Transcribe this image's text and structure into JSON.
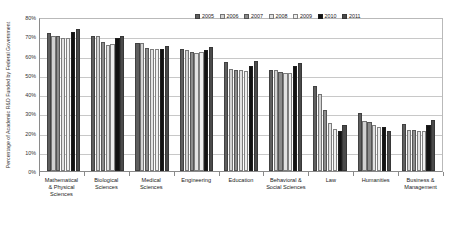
{
  "chart_data": {
    "type": "bar",
    "title": "",
    "xlabel": "",
    "ylabel": "Percentage of Academic R&D Funded by Federal Government",
    "ylim": [
      0,
      80
    ],
    "ytick_labels": [
      "80%",
      "70%",
      "60%",
      "50%",
      "40%",
      "30%",
      "20%",
      "10%",
      "0%"
    ],
    "ytick_values": [
      80,
      70,
      60,
      50,
      40,
      30,
      20,
      10,
      0
    ],
    "grid": true,
    "legend_position": "top-right",
    "categories": [
      "Mathematical & Physical Sciences",
      "Biological Sciences",
      "Medical Sciences",
      "Engineering",
      "Education",
      "Behavioral & Social Sciences",
      "Law",
      "Humanities",
      "Business & Management"
    ],
    "category_lines": [
      [
        "Mathematical",
        "& Physical",
        "Sciences"
      ],
      [
        "Biological",
        "Sciences"
      ],
      [
        "Medical",
        "Sciences"
      ],
      [
        "Engineering"
      ],
      [
        "Education"
      ],
      [
        "Behavioral &",
        "Social Sciences"
      ],
      [
        "Law"
      ],
      [
        "Humanities"
      ],
      [
        "Business &",
        "Management"
      ]
    ],
    "series": [
      {
        "name": "2005",
        "color": "#5f5f5f",
        "values": [
          71.8,
          70.2,
          66.6,
          63.2,
          56.4,
          52.6,
          44.3,
          30.3,
          24.2
        ]
      },
      {
        "name": "2006",
        "color": "#d2d2d2",
        "values": [
          70.0,
          70.1,
          66.6,
          63.0,
          52.9,
          52.6,
          40.2,
          25.8,
          21.1
        ]
      },
      {
        "name": "2007",
        "color": "#8c8c8c",
        "values": [
          70.0,
          67.2,
          64.0,
          61.7,
          52.4,
          51.5,
          31.6,
          25.6,
          21.1
        ]
      },
      {
        "name": "2008",
        "color": "#e2e2e2",
        "values": [
          69.1,
          65.4,
          63.5,
          61.4,
          52.3,
          50.9,
          25.0,
          23.7,
          21.0
        ]
      },
      {
        "name": "2009",
        "color": "#efefef",
        "values": [
          69.0,
          65.8,
          63.4,
          61.6,
          51.8,
          50.9,
          22.0,
          23.1,
          21.0
        ]
      },
      {
        "name": "2010",
        "color": "#121212",
        "values": [
          72.3,
          69.1,
          63.2,
          63.0,
          54.8,
          54.4,
          21.0,
          23.0,
          23.8
        ]
      },
      {
        "name": "2011",
        "color": "#4a4a4a",
        "values": [
          73.6,
          69.9,
          65.0,
          64.3,
          57.0,
          56.1,
          23.9,
          21.0,
          26.3
        ]
      }
    ]
  }
}
